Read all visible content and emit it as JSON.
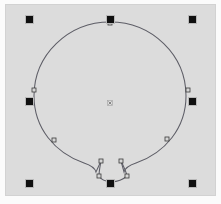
{
  "app": {
    "title": "Vector Shape Editor Canvas",
    "mode": "selection",
    "canvas_background": "#dcdcdc",
    "page_background": "#fbfbfb"
  },
  "canvas": {
    "x": 6,
    "y": 5,
    "width": 209,
    "height": 190,
    "fill": "#dcdcdc",
    "border_color": "#d2d2d2"
  },
  "selection": {
    "handle_color": "#101010",
    "handle_size": 7,
    "bounds": {
      "x": 29,
      "y": 19,
      "width": 163,
      "height": 164
    },
    "handles": [
      {
        "name": "handle-top-left",
        "x": 29,
        "y": 19
      },
      {
        "name": "handle-top-center",
        "x": 110,
        "y": 19
      },
      {
        "name": "handle-top-right",
        "x": 192,
        "y": 19
      },
      {
        "name": "handle-middle-left",
        "x": 29,
        "y": 101
      },
      {
        "name": "handle-middle-right",
        "x": 192,
        "y": 101
      },
      {
        "name": "handle-bottom-left",
        "x": 29,
        "y": 183
      },
      {
        "name": "handle-bottom-center",
        "x": 110,
        "y": 183
      },
      {
        "name": "handle-bottom-right",
        "x": 192,
        "y": 183
      }
    ]
  },
  "shape": {
    "name": "balloon",
    "stroke_color": "#5d5d66",
    "stroke_width": 1.05,
    "fill": "none",
    "body": {
      "type": "ellipse",
      "cx": 110,
      "cy": 96,
      "rx": 76,
      "ry": 74
    },
    "neck": {
      "left_top_x": 101,
      "left_top_y": 161,
      "left_bottom_x": 99,
      "left_bottom_y": 176,
      "right_top_x": 121,
      "right_top_y": 161,
      "right_bottom_x": 127,
      "right_bottom_y": 176,
      "knot_x": 110,
      "knot_y": 183
    },
    "nodes": [
      {
        "name": "node-top",
        "x": 110,
        "y": 23
      },
      {
        "name": "node-left",
        "x": 34,
        "y": 90
      },
      {
        "name": "node-right",
        "x": 188,
        "y": 90
      },
      {
        "name": "node-lower-left",
        "x": 54,
        "y": 140
      },
      {
        "name": "node-lower-right",
        "x": 167,
        "y": 139
      },
      {
        "name": "node-neck-left-top",
        "x": 101,
        "y": 161
      },
      {
        "name": "node-neck-right-top",
        "x": 121,
        "y": 161
      },
      {
        "name": "node-neck-left-bottom",
        "x": 99,
        "y": 176
      },
      {
        "name": "node-neck-right-bottom",
        "x": 127,
        "y": 176
      }
    ],
    "node_fill": "#d6d6d6",
    "node_stroke": "#3a3a3a"
  },
  "center_marker": {
    "name": "object-center-marker",
    "x": 110,
    "y": 103,
    "size": 5,
    "color": "#7b7b7b"
  }
}
